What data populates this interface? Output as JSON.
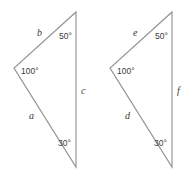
{
  "figure": {
    "name": "two-congruent-triangles",
    "background_color": "#ffffff",
    "stroke_color": "#8e8e8e",
    "text_color": "#3a3a3a",
    "triangles": [
      {
        "id": "left-triangle",
        "vertices": {
          "apex": {
            "x": 76,
            "y": 12
          },
          "left": {
            "x": 14,
            "y": 68
          },
          "bottom": {
            "x": 76,
            "y": 167
          }
        },
        "sides": [
          {
            "key": "b",
            "label": "b",
            "x": 37,
            "y": 36,
            "between": "apex-left"
          },
          {
            "key": "a",
            "label": "a",
            "x": 29,
            "y": 119,
            "between": "left-bottom"
          },
          {
            "key": "c",
            "label": "c",
            "x": 81,
            "y": 94,
            "between": "apex-bottom"
          }
        ],
        "angles": [
          {
            "key": "apex",
            "label": "50°",
            "x": 59,
            "y": 39
          },
          {
            "key": "left",
            "label": "100°",
            "x": 21,
            "y": 74
          },
          {
            "key": "bottom",
            "label": "30°",
            "x": 58,
            "y": 146
          }
        ]
      },
      {
        "id": "right-triangle",
        "vertices": {
          "apex": {
            "x": 172,
            "y": 12
          },
          "left": {
            "x": 110,
            "y": 68
          },
          "bottom": {
            "x": 172,
            "y": 167
          }
        },
        "sides": [
          {
            "key": "e",
            "label": "e",
            "x": 133,
            "y": 36,
            "between": "apex-left"
          },
          {
            "key": "d",
            "label": "d",
            "x": 125,
            "y": 119,
            "between": "left-bottom"
          },
          {
            "key": "f",
            "label": "f",
            "x": 177,
            "y": 94,
            "between": "apex-bottom"
          }
        ],
        "angles": [
          {
            "key": "apex",
            "label": "50°",
            "x": 155,
            "y": 39
          },
          {
            "key": "left",
            "label": "100°",
            "x": 117,
            "y": 74
          },
          {
            "key": "bottom",
            "label": "30°",
            "x": 154,
            "y": 146
          }
        ]
      }
    ]
  }
}
